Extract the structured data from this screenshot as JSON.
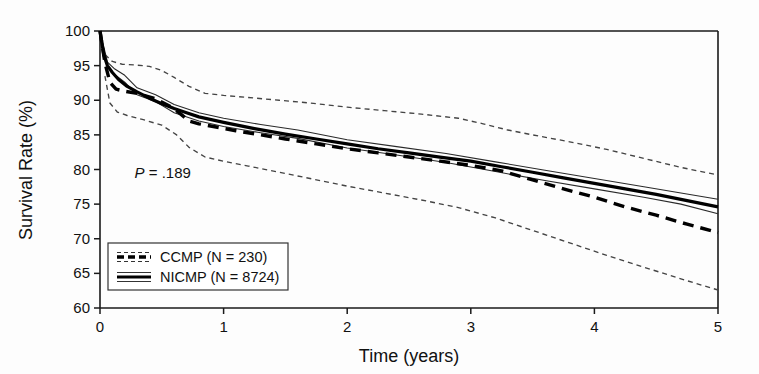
{
  "chart_data": {
    "type": "line",
    "title": "",
    "xlabel": "Time (years)",
    "ylabel": "Survival Rate (%)",
    "xlim": [
      0,
      5
    ],
    "ylim": [
      60,
      100
    ],
    "xticks": [
      "0",
      "1",
      "2",
      "3",
      "4",
      "5"
    ],
    "yticks": [
      "100",
      "95",
      "90",
      "85",
      "80",
      "75",
      "70",
      "65",
      "60"
    ],
    "grid": false,
    "legend_position": "lower-left",
    "annotations": [
      {
        "name": "p-value",
        "text_italic": "P",
        "text_rest": " = .189",
        "full": "P = .189",
        "x": 0.28,
        "y": 79.5
      }
    ],
    "series": [
      {
        "name": "CCMP (N = 230)",
        "label": "CCMP (N = 230)",
        "style": "dashed",
        "color": "#000000",
        "n": 230,
        "x": [
          0,
          0.04,
          0.08,
          0.13,
          0.2,
          0.3,
          0.45,
          0.6,
          0.72,
          0.8,
          0.95,
          1.1,
          1.3,
          1.5,
          1.75,
          2.0,
          2.25,
          2.5,
          2.75,
          3.0,
          3.25,
          3.5,
          3.75,
          4.0,
          4.25,
          4.5,
          4.75,
          5.0
        ],
        "y": [
          100,
          95.4,
          92.6,
          91.6,
          91.3,
          91.0,
          90.2,
          88.8,
          87.0,
          86.6,
          86.1,
          85.6,
          85.0,
          84.4,
          83.7,
          83.0,
          82.4,
          81.8,
          81.2,
          80.6,
          79.8,
          78.5,
          77.2,
          76.0,
          74.6,
          73.4,
          72.1,
          70.9
        ]
      },
      {
        "name": "NICMP (N = 8724)",
        "label": "NICMP (N = 8724)",
        "style": "solid",
        "color": "#000000",
        "n": 8724,
        "x": [
          0,
          0.03,
          0.06,
          0.1,
          0.15,
          0.22,
          0.3,
          0.4,
          0.5,
          0.6,
          0.7,
          0.8,
          0.9,
          1.0,
          1.25,
          1.5,
          1.75,
          2.0,
          2.25,
          2.5,
          2.75,
          3.0,
          3.25,
          3.5,
          3.75,
          4.0,
          4.25,
          4.5,
          4.75,
          5.0
        ],
        "y": [
          100,
          96.6,
          95.0,
          94.0,
          93.0,
          92.0,
          91.2,
          90.3,
          89.5,
          88.8,
          88.2,
          87.6,
          87.2,
          86.8,
          85.9,
          85.1,
          84.4,
          83.7,
          83.0,
          82.4,
          81.8,
          81.2,
          80.4,
          79.6,
          78.8,
          78.0,
          77.2,
          76.4,
          75.5,
          74.6
        ]
      }
    ],
    "confidence_bands": [
      {
        "name": "CCMP upper 95% CI",
        "belongs_to": "CCMP (N = 230)",
        "style": "dotted",
        "x": [
          0.04,
          0.1,
          0.18,
          0.28,
          0.4,
          0.5,
          0.6,
          0.72,
          0.85,
          1.0,
          1.2,
          1.45,
          1.7,
          2.0,
          2.3,
          2.6,
          2.9,
          3.1,
          3.3,
          3.5,
          3.8,
          4.1,
          4.4,
          4.7,
          5.0
        ],
        "y": [
          96.6,
          95.6,
          95.2,
          95.1,
          94.9,
          94.3,
          93.3,
          92.0,
          91.0,
          90.7,
          90.4,
          90.0,
          89.6,
          89.0,
          88.5,
          88.0,
          87.4,
          86.6,
          85.7,
          85.0,
          84.0,
          82.9,
          81.6,
          80.3,
          79.2
        ]
      },
      {
        "name": "CCMP lower 95% CI",
        "belongs_to": "CCMP (N = 230)",
        "style": "dotted",
        "x": [
          0.04,
          0.08,
          0.14,
          0.22,
          0.35,
          0.5,
          0.62,
          0.72,
          0.85,
          1.0,
          1.2,
          1.45,
          1.7,
          2.0,
          2.3,
          2.6,
          2.9,
          3.2,
          3.5,
          3.8,
          4.1,
          4.4,
          4.7,
          5.0
        ],
        "y": [
          93.5,
          89.6,
          88.3,
          87.8,
          87.2,
          86.4,
          85.0,
          83.2,
          81.8,
          81.2,
          80.5,
          79.6,
          78.7,
          77.6,
          76.6,
          75.6,
          74.5,
          73.0,
          71.2,
          69.4,
          67.6,
          65.9,
          64.2,
          62.6
        ]
      },
      {
        "name": "NICMP upper 95% CI",
        "belongs_to": "NICMP (N = 8724)",
        "style": "thin-solid",
        "x": [
          0,
          0.06,
          0.12,
          0.2,
          0.3,
          0.45,
          0.6,
          0.8,
          1.0,
          1.3,
          1.6,
          2.0,
          2.4,
          2.8,
          3.2,
          3.6,
          4.0,
          4.4,
          4.7,
          5.0
        ],
        "y": [
          100,
          95.5,
          94.5,
          93.6,
          91.8,
          90.8,
          89.4,
          88.2,
          87.4,
          86.5,
          85.7,
          84.3,
          83.3,
          82.3,
          81.1,
          79.9,
          78.7,
          77.5,
          76.6,
          75.7
        ]
      },
      {
        "name": "NICMP lower 95% CI",
        "belongs_to": "NICMP (N = 8724)",
        "style": "thin-solid",
        "x": [
          0,
          0.06,
          0.12,
          0.2,
          0.3,
          0.45,
          0.6,
          0.8,
          1.0,
          1.3,
          1.6,
          2.0,
          2.4,
          2.8,
          3.2,
          3.6,
          4.0,
          4.4,
          4.7,
          5.0
        ],
        "y": [
          100,
          95.0,
          93.7,
          92.6,
          90.8,
          89.8,
          88.2,
          87.0,
          86.2,
          85.3,
          84.5,
          83.1,
          82.1,
          81.0,
          79.7,
          78.4,
          77.2,
          76.0,
          75.0,
          73.6
        ]
      }
    ]
  },
  "legend": {
    "items": [
      {
        "label": "CCMP (N = 230)",
        "style": "dashed"
      },
      {
        "label": "NICMP (N = 8724)",
        "style": "solid"
      }
    ]
  },
  "axes": {
    "x_title": "Time (years)",
    "y_title": "Survival Rate (%)"
  }
}
